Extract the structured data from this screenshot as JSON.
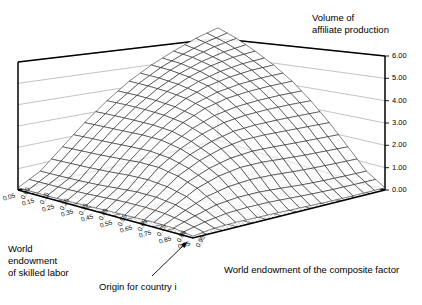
{
  "figure": {
    "background": "#ffffff",
    "ink": "#000000",
    "floor_fill": "#ffffff",
    "floor_dot": "#8a8a8a"
  },
  "labels": {
    "z_title_line1": "Volume of",
    "z_title_line2": "affiliate production",
    "x_title": "World endowment of the composite factor",
    "y_title_line1": "World",
    "y_title_line2": "endowment",
    "y_title_line3": "of skilled labor",
    "origin_annotation": "Origin for country i"
  },
  "chart_data": {
    "type": "surface",
    "xlabel": "World endowment of the composite factor",
    "ylabel": "World endowment of skilled labor",
    "zlabel": "Volume of affiliate production",
    "grid": true,
    "legend": "none",
    "zlim": [
      0.0,
      6.0
    ],
    "z_ticks": [
      "0.00",
      "1.00",
      "2.00",
      "3.00",
      "4.00",
      "5.00",
      "6.00"
    ],
    "z_tick_values": [
      0,
      1,
      2,
      3,
      4,
      5,
      6
    ],
    "x_ticks": [
      "0.05",
      "0.15",
      "0.25",
      "0.35",
      "0.45",
      "0.55",
      "0.65",
      "0.75",
      "0.85",
      "0.95"
    ],
    "x_tick_values": [
      0.05,
      0.15,
      0.25,
      0.35,
      0.45,
      0.55,
      0.65,
      0.75,
      0.85,
      0.95
    ],
    "y_ticks": [
      "0.05",
      "0.15",
      "0.25",
      "0.35",
      "0.45",
      "0.55",
      "0.65",
      "0.75",
      "0.85",
      "0.95"
    ],
    "y_tick_values": [
      0.05,
      0.15,
      0.25,
      0.35,
      0.45,
      0.55,
      0.65,
      0.75,
      0.85,
      0.95
    ],
    "xlim": [
      0.05,
      0.95
    ],
    "ylim": [
      0.05,
      0.95
    ],
    "z_values": [
      [
        5.2,
        4.95,
        4.6,
        4.2,
        3.7,
        3.05,
        2.3,
        1.45,
        0.6,
        0.1
      ],
      [
        4.95,
        4.8,
        4.55,
        4.2,
        3.72,
        3.1,
        2.35,
        1.5,
        0.62,
        0.1
      ],
      [
        4.6,
        4.55,
        4.4,
        4.12,
        3.7,
        3.12,
        2.4,
        1.55,
        0.65,
        0.1
      ],
      [
        4.2,
        4.2,
        4.12,
        3.95,
        3.62,
        3.1,
        2.45,
        1.62,
        0.7,
        0.12
      ],
      [
        3.7,
        3.72,
        3.7,
        3.62,
        3.4,
        3.0,
        2.45,
        1.7,
        0.78,
        0.15
      ],
      [
        3.05,
        3.1,
        3.12,
        3.1,
        3.0,
        2.72,
        2.3,
        1.7,
        0.85,
        0.18
      ],
      [
        2.3,
        2.35,
        2.4,
        2.45,
        2.45,
        2.3,
        2.0,
        1.55,
        0.85,
        0.2
      ],
      [
        1.45,
        1.5,
        1.55,
        1.62,
        1.7,
        1.7,
        1.55,
        1.25,
        0.75,
        0.22
      ],
      [
        0.6,
        0.62,
        0.65,
        0.7,
        0.78,
        0.85,
        0.85,
        0.75,
        0.5,
        0.2
      ],
      [
        0.1,
        0.1,
        0.1,
        0.12,
        0.15,
        0.18,
        0.2,
        0.22,
        0.2,
        0.08
      ]
    ]
  }
}
